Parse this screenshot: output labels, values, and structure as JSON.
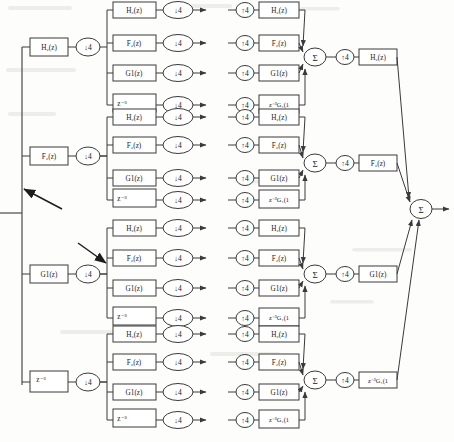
{
  "diagram": {
    "kind": "block-diagram",
    "background_color": "#fdfdfb",
    "line_color": "#3a3a3a",
    "text_color": "#1b1b1b"
  },
  "labels": {
    "H2": "H₂(z)",
    "F2": "F₂(z)",
    "G1": "G1(z)",
    "z3": "z⁻³",
    "z3G1": "z⁻³G₁(1",
    "down4": "↓4",
    "up4": "↑4",
    "sum": "Σ"
  },
  "stage1": {
    "name": "analysis-stage-1",
    "branches": [
      {
        "filter": "H₂(z)",
        "sampler": "↓4"
      },
      {
        "filter": "F₂(z)",
        "sampler": "↓4"
      },
      {
        "filter": "G1(z)",
        "sampler": "↓4"
      },
      {
        "filter": "z⁻³",
        "sampler": "↓4"
      }
    ]
  },
  "stage2": {
    "name": "analysis-stage-2",
    "group_count": 4,
    "branches_per_group": 4,
    "branches": [
      {
        "filter": "H₂(z)",
        "sampler": "↓4"
      },
      {
        "filter": "F₂(z)",
        "sampler": "↓4"
      },
      {
        "filter": "G1(z)",
        "sampler": "↓4"
      },
      {
        "filter": "z⁻³",
        "sampler": "↓4"
      }
    ]
  },
  "synthesis": {
    "name": "synthesis-stage-1",
    "group_count": 4,
    "branches": [
      {
        "sampler": "↑4",
        "filter": "H₂(z)"
      },
      {
        "sampler": "↑4",
        "filter": "F₂(z)"
      },
      {
        "sampler": "↑4",
        "filter": "G1(z)"
      },
      {
        "sampler": "↑4",
        "filter": "z⁻³G₁(1"
      }
    ],
    "summer": "Σ"
  },
  "synthesis2": {
    "name": "synthesis-stage-2",
    "branches": [
      {
        "sampler": "↑4",
        "filter": "H₂(z)"
      },
      {
        "sampler": "↑4",
        "filter": "F₂(z)"
      },
      {
        "sampler": "↑4",
        "filter": "G1(z)"
      },
      {
        "sampler": "↑4",
        "filter": "z⁻³G₁(1"
      }
    ],
    "summer": "Σ"
  },
  "annotations": [
    {
      "name": "pen-arrow-upper",
      "points_to": "input-trunk"
    },
    {
      "name": "pen-arrow-lower",
      "points_to": "stage2-branch-node"
    }
  ]
}
